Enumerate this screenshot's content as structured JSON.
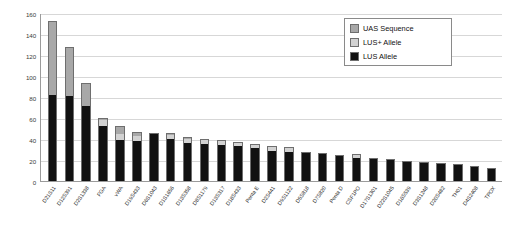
{
  "chart_data": {
    "type": "bar",
    "title": "",
    "subtitle": "",
    "xlabel": "",
    "ylabel": "Allele Count",
    "ylim": [
      0,
      160
    ],
    "yticks": [
      0,
      20,
      40,
      60,
      80,
      100,
      120,
      140,
      160
    ],
    "grid": true,
    "stacked": true,
    "legend_position": "top-right",
    "categories": [
      "D21S11",
      "D12S391",
      "D2S1338",
      "FGA",
      "vWA",
      "D19S433",
      "D6S1043",
      "D1S1656",
      "D13S358",
      "D8S1179",
      "D13S317",
      "D18S433",
      "Penta E",
      "D2S441",
      "D9S1122",
      "D5S818",
      "D7S820",
      "Penta D",
      "CSF1PO",
      "D17S1301",
      "D22S1045",
      "D16S539",
      "D3S1248",
      "D20S482",
      "TH01",
      "D4S2408",
      "TPOX"
    ],
    "series": [
      {
        "name": "LUS Allele",
        "color": "#111111",
        "values": [
          82,
          81,
          71,
          52,
          39,
          38,
          45,
          40,
          36,
          35,
          34,
          33,
          31,
          29,
          28,
          27,
          26,
          24,
          22,
          21,
          20,
          18,
          17,
          16,
          15,
          13,
          11
        ]
      },
      {
        "name": "LUS+ Allele",
        "color": "#d2d2d2",
        "values": [
          0,
          0,
          0,
          6,
          6,
          5,
          0,
          4,
          4,
          4,
          4,
          3,
          3,
          3,
          3,
          0,
          0,
          0,
          3,
          0,
          0,
          0,
          0,
          0,
          0,
          0,
          0
        ]
      },
      {
        "name": "UAS Sequence",
        "color": "#a8a8a8",
        "values": [
          69,
          46,
          21,
          1,
          6,
          3,
          0,
          1,
          1,
          0,
          0,
          0,
          0,
          0,
          0,
          0,
          0,
          0,
          0,
          0,
          0,
          0,
          0,
          0,
          0,
          0,
          0
        ]
      }
    ],
    "legend": [
      {
        "label": "UAS Sequence",
        "color": "#a8a8a8"
      },
      {
        "label": "LUS+ Allele",
        "color": "#d2d2d2"
      },
      {
        "label": "LUS Allele",
        "color": "#111111"
      }
    ]
  }
}
